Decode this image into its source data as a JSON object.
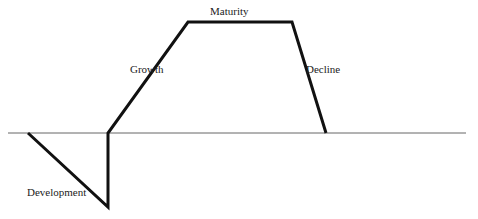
{
  "diagram": {
    "stages": [
      {
        "label": "Development",
        "x": 27,
        "y": 186
      },
      {
        "label": "Growth",
        "x": 130,
        "y": 63
      },
      {
        "label": "Maturity",
        "x": 210,
        "y": 5
      },
      {
        "label": "Decline",
        "x": 306,
        "y": 63
      }
    ],
    "axis": {
      "x1": 8,
      "x2": 466,
      "y": 133,
      "color": "#666666"
    },
    "curve_points": [
      [
        28,
        133
      ],
      [
        108,
        207
      ],
      [
        108,
        133
      ],
      [
        188,
        22
      ],
      [
        292,
        22
      ],
      [
        326,
        133
      ]
    ],
    "curve_color": "#111111"
  }
}
